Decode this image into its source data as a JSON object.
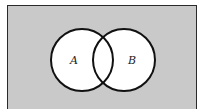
{
  "diagram": {
    "type": "venn",
    "universe_color": "#c9c9c9",
    "set_fill": "#ffffff",
    "stroke_color": "#111111",
    "sets": [
      {
        "label": "A",
        "cx": 82,
        "cy": 60,
        "r": 31
      },
      {
        "label": "B",
        "cx": 124,
        "cy": 60,
        "r": 31
      }
    ]
  }
}
